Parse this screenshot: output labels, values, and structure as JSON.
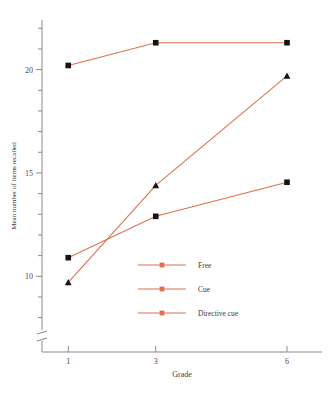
{
  "chart_data": {
    "type": "line",
    "title": "",
    "xlabel": "Grade",
    "ylabel": "Mean number of items recalled",
    "x": [
      1,
      3,
      6
    ],
    "categories": [
      "1",
      "3",
      "6"
    ],
    "xtick_labels": [
      "1",
      "3",
      "6"
    ],
    "ytick_labels": [
      "10",
      "15",
      "20"
    ],
    "ytick_values": [
      10,
      15,
      20
    ],
    "yminor_values": [
      8,
      9,
      11,
      12,
      13,
      14,
      16,
      17,
      18,
      19,
      21,
      22
    ],
    "xlim": [
      0.4,
      6.8
    ],
    "ylim": [
      7.4,
      22.4
    ],
    "grid": false,
    "legend_position": "inside-lower-center",
    "axis_break": true,
    "series": [
      {
        "name": "Free",
        "marker": "square",
        "values": [
          20.2,
          21.3,
          21.3
        ],
        "color": "#e0714c"
      },
      {
        "name": "Cue",
        "marker": "square",
        "values": [
          10.9,
          12.9,
          14.55
        ],
        "color": "#e0714c"
      },
      {
        "name": "Directive cue",
        "marker": "triangle",
        "values": [
          9.7,
          14.4,
          19.7
        ],
        "color": "#e0714c"
      }
    ],
    "marker_color": "#141414",
    "line_color": "#e0714c",
    "axis_color": "#8a8a8a"
  },
  "legend": {
    "items": [
      {
        "label": "Free"
      },
      {
        "label": "Cue"
      },
      {
        "label": "Directive cue"
      }
    ]
  },
  "axes": {
    "y_title": "Mean number of items recalled",
    "x_title": "Grade",
    "y_ticks": [
      "20",
      "15",
      "10"
    ],
    "x_ticks": [
      "1",
      "3",
      "6"
    ]
  }
}
